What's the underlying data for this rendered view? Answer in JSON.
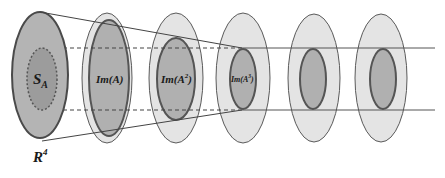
{
  "diagram": {
    "colors": {
      "background": "#ffffff",
      "outer_fill": "#e4e4e4",
      "first_fill": "#b4b4b4",
      "inner_fill": "#a8a8a8",
      "sa_fill": "#9a9a9a",
      "stroke": "#4a4a4a",
      "inner_stroke": "#555555"
    },
    "labels": {
      "space": "R",
      "space_sup": "4",
      "sa": "S",
      "sa_sub": "A",
      "im1": "Im(A)",
      "im2_base": "Im(A",
      "im2_sup": "2",
      "im2_close": ")",
      "im3_base": "Im(A",
      "im3_sup": "3",
      "im3_close": ")"
    },
    "stages": [
      {
        "name": "R4",
        "outer": {
          "cx": 40,
          "cy": 75,
          "rx": 28,
          "ry": 63
        }
      },
      {
        "name": "Im(A)",
        "outer": {
          "cx": 107,
          "cy": 78,
          "rx": 25,
          "ry": 65
        },
        "inner": {
          "cx": 109,
          "cy": 78,
          "rx": 20,
          "ry": 58
        }
      },
      {
        "name": "Im(A^2)",
        "outer": {
          "cx": 176,
          "cy": 78,
          "rx": 27,
          "ry": 65
        },
        "inner": {
          "cx": 176,
          "cy": 79,
          "rx": 19,
          "ry": 41
        }
      },
      {
        "name": "Im(A^3)",
        "outer": {
          "cx": 243,
          "cy": 78,
          "rx": 27,
          "ry": 65
        },
        "inner": {
          "cx": 243,
          "cy": 79,
          "rx": 13,
          "ry": 30
        }
      },
      {
        "name": "Im(A^4)",
        "outer": {
          "cx": 314,
          "cy": 78,
          "rx": 26,
          "ry": 64
        },
        "inner": {
          "cx": 313,
          "cy": 79,
          "rx": 13,
          "ry": 30
        }
      },
      {
        "name": "Im(A^5)",
        "outer": {
          "cx": 381,
          "cy": 78,
          "rx": 26,
          "ry": 64
        },
        "inner": {
          "cx": 383,
          "cy": 79,
          "rx": 13,
          "ry": 30
        }
      }
    ]
  }
}
